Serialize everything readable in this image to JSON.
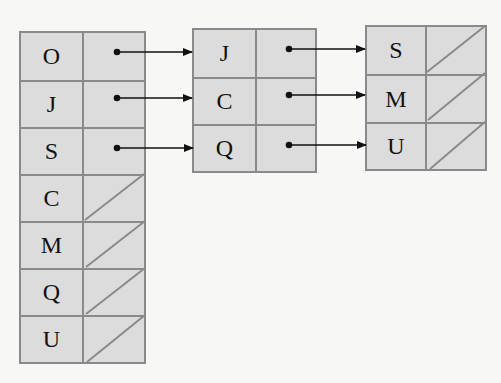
{
  "diagram": {
    "type": "hash-table-chaining",
    "colors": {
      "cell_fill": "#dcdcdc",
      "border": "#8a8a8a",
      "arrow": "#111111",
      "background": "#f7f7f6"
    },
    "columns": [
      {
        "id": "table1",
        "rows": [
          {
            "key": "O",
            "pointer": "J"
          },
          {
            "key": "J",
            "pointer": "C"
          },
          {
            "key": "S",
            "pointer": "Q"
          },
          {
            "key": "C",
            "pointer": null
          },
          {
            "key": "M",
            "pointer": null
          },
          {
            "key": "Q",
            "pointer": null
          },
          {
            "key": "U",
            "pointer": null
          }
        ]
      },
      {
        "id": "table2",
        "rows": [
          {
            "key": "J",
            "pointer": "S"
          },
          {
            "key": "C",
            "pointer": "M"
          },
          {
            "key": "Q",
            "pointer": "U"
          }
        ]
      },
      {
        "id": "table3",
        "rows": [
          {
            "key": "S",
            "pointer": null
          },
          {
            "key": "M",
            "pointer": null
          },
          {
            "key": "U",
            "pointer": null
          }
        ]
      }
    ]
  }
}
